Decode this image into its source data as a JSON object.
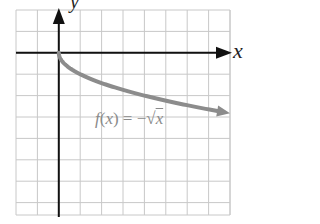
{
  "chart_data": {
    "type": "line",
    "title": "",
    "xlabel": "x",
    "ylabel": "y",
    "function_label": "f(x) = −√x",
    "function_label_parts": {
      "f": "f",
      "open": "(",
      "var": "x",
      "close": ") = −√",
      "rad": "x"
    },
    "xlim": [
      -2,
      8
    ],
    "ylim": [
      -7.6,
      2
    ],
    "grid": true,
    "grid_step": 1,
    "series": [
      {
        "name": "f(x) = −√x",
        "color": "#8c8c8c",
        "x": [
          0,
          0.25,
          0.5,
          1,
          2,
          3,
          4,
          5,
          6,
          7,
          8
        ],
        "y": [
          0,
          -0.5,
          -0.71,
          -1,
          -1.41,
          -1.73,
          -2,
          -2.24,
          -2.45,
          -2.65,
          -2.83
        ]
      }
    ]
  },
  "colors": {
    "grid": "#c8c8c8",
    "axis": "#111111",
    "curve": "#8c8c8c",
    "label": "#8a8a8a"
  }
}
